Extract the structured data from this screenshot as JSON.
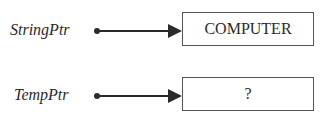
{
  "diagram": {
    "pointers": [
      {
        "name": "StringPtr",
        "target_value": "COMPUTER"
      },
      {
        "name": "TempPtr",
        "target_value": "?"
      }
    ]
  },
  "colors": {
    "line": "#2a2a2a",
    "box_border": "#555555",
    "text": "#2a2a2a"
  }
}
